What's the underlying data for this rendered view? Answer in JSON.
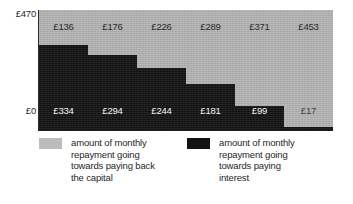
{
  "chart_data": {
    "type": "bar",
    "title": "",
    "subtitle": "",
    "xlabel": "",
    "ylabel": "",
    "ylim": [
      0,
      470
    ],
    "grid": false,
    "stacked": true,
    "legend_position": "bottom",
    "categories": [
      "1",
      "2",
      "3",
      "4",
      "5",
      "6"
    ],
    "y_tick_labels": [
      "£0",
      "£470"
    ],
    "y_ticks": [
      0,
      470
    ],
    "total_per_bar": 470,
    "series": [
      {
        "name": "amount of monthly repayment going towards paying back the capital",
        "color": "#b5b5b5",
        "values": [
          136,
          176,
          226,
          289,
          371,
          453
        ],
        "labels": [
          "£136",
          "£176",
          "£226",
          "£289",
          "£371",
          "£453"
        ]
      },
      {
        "name": "amount of monthly repayment going towards paying interest",
        "color": "#121212",
        "values": [
          334,
          294,
          244,
          181,
          99,
          17
        ],
        "labels": [
          "£334",
          "£294",
          "£244",
          "£181",
          "£99",
          "£17"
        ]
      }
    ]
  },
  "axis": {
    "y_top_label": "£470",
    "y_bottom_label": "£0"
  },
  "legend": {
    "capital": {
      "swatch_color": "#bcbcbc",
      "lines": [
        "amount of monthly",
        "repayment going",
        "towards paying back",
        "the capital"
      ]
    },
    "interest": {
      "swatch_color": "#121212",
      "lines": [
        "amount of monthly",
        "repayment going",
        "towards paying",
        "interest"
      ]
    }
  }
}
